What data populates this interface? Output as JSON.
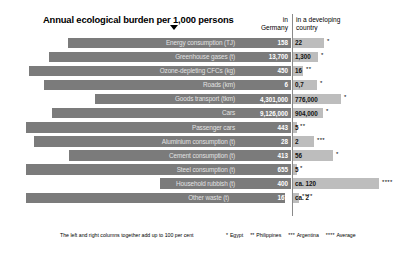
{
  "header": {
    "title": "Annual ecological burden per 1,000 persons",
    "col_germany": "in\nGermany",
    "col_germany_line1": "in",
    "col_germany_line2": "Germany",
    "col_developing_line1": "in a developing",
    "col_developing_line2": "country"
  },
  "footer": {
    "note": "The left and right columns together add up to 100 per cent",
    "legend": [
      {
        "marker": "*",
        "label": "Egypt"
      },
      {
        "marker": "**",
        "label": "Philippines"
      },
      {
        "marker": "***",
        "label": "Argentina"
      },
      {
        "marker": "****",
        "label": "Average"
      }
    ]
  },
  "chart_data": {
    "type": "bar",
    "title": "Annual ecological burden per 1,000 persons",
    "subtitle": "",
    "xlabel": "",
    "ylabel": "",
    "orientation": "horizontal",
    "layout": "diverging-paired",
    "grid": false,
    "legend_position": "bottom-right",
    "series": [
      {
        "name": "in Germany",
        "color": "#7b7b7b"
      },
      {
        "name": "in a developing country",
        "color": "#bdbdbd"
      }
    ],
    "note": "The left and right columns together add up to 100 per cent",
    "categories": [
      "Energy consumption (TJ)",
      "Greenhouse gases (t)",
      "Ozone-depleting CFCs (kg)",
      "Roads (km)",
      "Goods transport (tkm)",
      "Cars",
      "Passenger cars",
      "Aluminium consumption (t)",
      "Cement consumption (t)",
      "Steel consumption (t)",
      "Household rubbish (t)",
      "Other waste (t)"
    ],
    "rows": [
      {
        "label": "Energy consumption (TJ)",
        "germany": "158",
        "developing": "22",
        "footnote": "*",
        "germany_share": 88,
        "developing_share": 12,
        "left_bar_start": 68,
        "left_bar_end": 291,
        "right_bar_width": 31
      },
      {
        "label": "Greenhouse gases (t)",
        "germany": "13,700",
        "developing": "1,300",
        "footnote": "*",
        "germany_share": 91,
        "developing_share": 9,
        "left_bar_start": 49,
        "left_bar_end": 291,
        "right_bar_width": 25
      },
      {
        "label": "Ozone-depleting CFCs (kg)",
        "germany": "450",
        "developing": "16",
        "footnote": "**",
        "germany_share": 97,
        "developing_share": 3,
        "left_bar_start": 29,
        "left_bar_end": 291,
        "right_bar_width": 10
      },
      {
        "label": "Roads (km)",
        "germany": "6",
        "developing": "0,7",
        "footnote": "*",
        "germany_share": 90,
        "developing_share": 10,
        "left_bar_start": 44,
        "left_bar_end": 291,
        "right_bar_width": 24
      },
      {
        "label": "Goods transport (tkm)",
        "germany": "4,301,000",
        "developing": "776,000",
        "footnote": "*",
        "germany_share": 85,
        "developing_share": 15,
        "left_bar_start": 95,
        "left_bar_end": 291,
        "right_bar_width": 48
      },
      {
        "label": "Cars",
        "germany": "9,126,000",
        "developing": "904,000",
        "footnote": "*",
        "germany_share": 91,
        "developing_share": 9,
        "left_bar_start": 52,
        "left_bar_end": 291,
        "right_bar_width": 30
      },
      {
        "label": "Passenger cars",
        "germany": "443",
        "developing": "5",
        "footnote": "**",
        "germany_share": 99,
        "developing_share": 1,
        "left_bar_start": 26,
        "left_bar_end": 291,
        "right_bar_width": 4
      },
      {
        "label": "Aluminium consumption (t)",
        "germany": "28",
        "developing": "2",
        "footnote": "***",
        "germany_share": 93,
        "developing_share": 7,
        "left_bar_start": 34,
        "left_bar_end": 291,
        "right_bar_width": 21
      },
      {
        "label": "Cement consumption (t)",
        "germany": "413",
        "developing": "56",
        "footnote": "*",
        "germany_share": 88,
        "developing_share": 12,
        "left_bar_start": 69,
        "left_bar_end": 291,
        "right_bar_width": 40
      },
      {
        "label": "Steel consumption (t)",
        "germany": "655",
        "developing": "5",
        "footnote": "*",
        "germany_share": 99,
        "developing_share": 1,
        "left_bar_start": 26,
        "left_bar_end": 291,
        "right_bar_width": 4
      },
      {
        "label": "Household rubbish (t)",
        "germany": "400",
        "developing": "ca. 120",
        "footnote": "****",
        "germany_share": 77,
        "developing_share": 23,
        "left_bar_start": 160,
        "left_bar_end": 291,
        "right_bar_width": 86
      },
      {
        "label": "Other waste (t)",
        "germany": "167",
        "developing": "ca. 2",
        "footnote": "****",
        "germany_share": 99,
        "developing_share": 1,
        "left_bar_start": 26,
        "left_bar_end": 285,
        "right_bar_width": 6
      }
    ]
  }
}
